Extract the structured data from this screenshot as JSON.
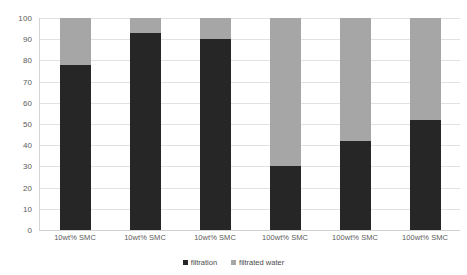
{
  "chart_data": {
    "type": "bar",
    "subtype": "stacked-bar",
    "title": "",
    "xlabel": "",
    "ylabel": "",
    "ylim": [
      0,
      100
    ],
    "ytick_step": 10,
    "yticks": [
      0,
      10,
      20,
      30,
      40,
      50,
      60,
      70,
      80,
      90,
      100
    ],
    "ytick_labels": [
      "0",
      "10",
      "20",
      "30",
      "40",
      "50",
      "60",
      "70",
      "80",
      "90",
      "100"
    ],
    "grid": true,
    "grid_axis": "y",
    "legend_position": "bottom-center",
    "categories": [
      "10wt% SMC",
      "10wt% SMC",
      "10wt% SMC",
      "100wt% SMC",
      "100wt% SMC",
      "100wt% SMC"
    ],
    "series": [
      {
        "name": "filtration",
        "color": "#262626",
        "values": [
          78,
          93,
          90,
          30,
          42,
          52
        ]
      },
      {
        "name": "filtrated water",
        "color": "#a6a6a6",
        "values": [
          22,
          7,
          10,
          70,
          58,
          48
        ]
      }
    ]
  },
  "legend": {
    "items": [
      {
        "label": "filtration",
        "color": "#262626"
      },
      {
        "label": "filtrated water",
        "color": "#a6a6a6"
      }
    ]
  },
  "colors": {
    "filtration": "#262626",
    "filtrated_water": "#a6a6a6",
    "gridline": "#e2e2e2",
    "axis_text": "#5a5a5a",
    "background": "#ffffff"
  }
}
